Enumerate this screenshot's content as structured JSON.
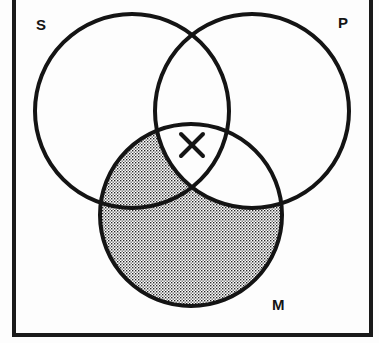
{
  "figure": {
    "type": "venn-diagram-syllogism",
    "background_color": "#fdfdfd",
    "ink_color": "#151515",
    "frame": {
      "name": "universe-box",
      "x": 14,
      "y": -4,
      "width": 357,
      "height": 339,
      "stroke_width": 4,
      "stroke_color": "#1a1a1a"
    },
    "circles": [
      {
        "id": "S",
        "label": "S",
        "cx": 132,
        "cy": 111,
        "r": 97,
        "stroke_width": 4,
        "stroke_color": "#141414",
        "label_x": 36,
        "label_y": 17
      },
      {
        "id": "P",
        "label": "P",
        "cx": 252,
        "cy": 111,
        "r": 97,
        "stroke_width": 4,
        "stroke_color": "#141414",
        "label_x": 338,
        "label_y": 15
      },
      {
        "id": "M",
        "label": "M",
        "cx": 191,
        "cy": 215,
        "r": 91,
        "stroke_width": 4,
        "stroke_color": "#141414",
        "label_x": 272,
        "label_y": 297
      }
    ],
    "shading": {
      "name": "shaded-region-M-not-P",
      "region": "M minus P",
      "pattern": "fine-dot-stipple",
      "dot_color": "#262626",
      "dot_spacing": 3,
      "dot_size": 1.4,
      "description": "The part of circle M lying outside circle P is stippled/shaded."
    },
    "marks": [
      {
        "name": "x-mark",
        "glyph": "X",
        "region": "S and P, outside M",
        "cx": 192,
        "cy": 145,
        "arm": 11,
        "stroke_width": 4,
        "stroke_color": "#151515"
      }
    ]
  }
}
